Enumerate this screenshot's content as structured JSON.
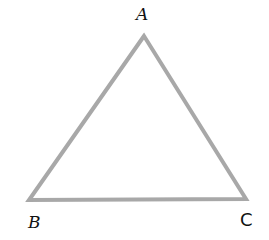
{
  "diagram": {
    "type": "triangle",
    "stroke_color": "#a8a8a8",
    "stroke_width": 4,
    "vertices": [
      {
        "name": "A",
        "x": 144,
        "y": 36
      },
      {
        "name": "B",
        "x": 29,
        "y": 200
      },
      {
        "name": "C",
        "x": 246,
        "y": 199
      }
    ],
    "labels": {
      "a": "A",
      "b": "B",
      "c": "C"
    }
  }
}
